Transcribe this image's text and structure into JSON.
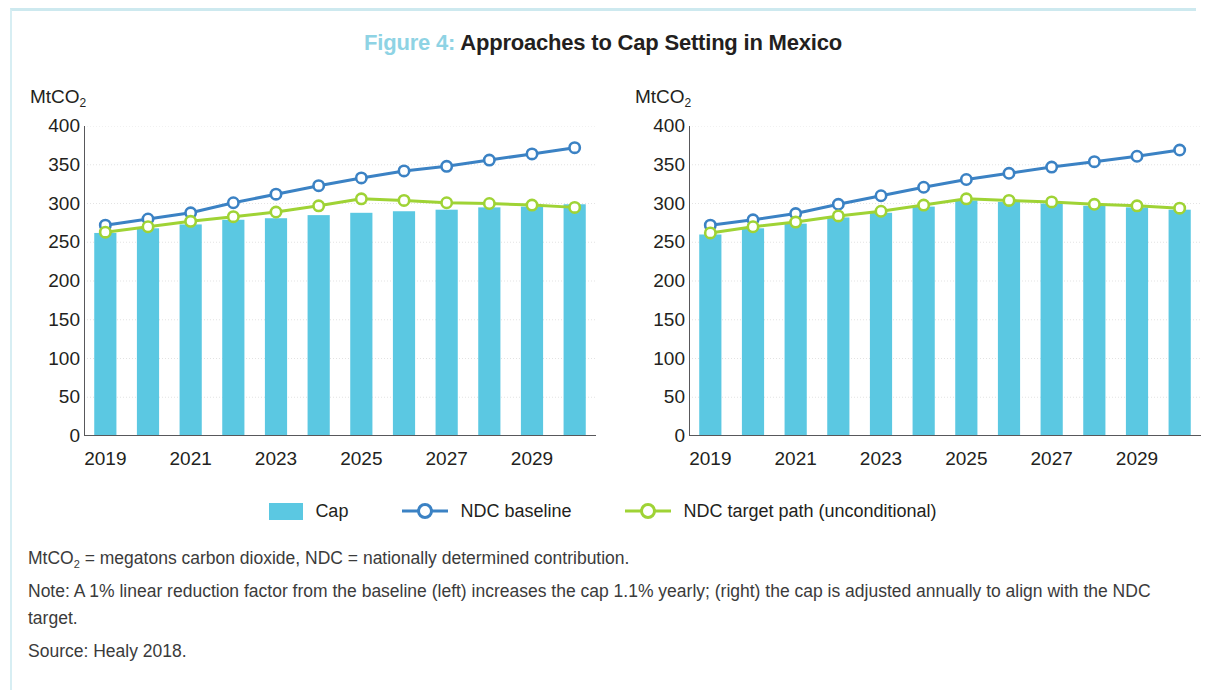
{
  "figure": {
    "label": "Figure 4:",
    "title": "Approaches to Cap Setting in Mexico",
    "label_color": "#8ed3e4",
    "title_color": "#231f20"
  },
  "colors": {
    "cap_bar": "#5bc8e2",
    "ndc_baseline": "#3b82c4",
    "ndc_target": "#9fd335",
    "marker_fill": "#ffffff",
    "gridline": "#e3e3e3",
    "axis": "#58585b",
    "border": "#cde9ef"
  },
  "legend": {
    "items": [
      {
        "label": "Cap",
        "type": "bar",
        "color": "#5bc8e2"
      },
      {
        "label": "NDC baseline",
        "type": "line-marker",
        "color": "#3b82c4"
      },
      {
        "label": "NDC target path (unconditional)",
        "type": "line-marker",
        "color": "#9fd335"
      }
    ]
  },
  "notes": {
    "abbrev_pre": "MtCO",
    "abbrev_sub": "2",
    "abbrev_post": " = megatons carbon dioxide, NDC = nationally determined contribution.",
    "note": "Note: A 1% linear reduction factor from the baseline (left) increases the cap 1.1% yearly; (right) the cap is adjusted annually to align with the NDC target.",
    "source": "Source: Healy 2018."
  },
  "chart_data": [
    {
      "type": "bar",
      "panel": "left",
      "title": "",
      "ylabel": "MtCO2",
      "ylabel_pre": "MtCO",
      "ylabel_sub": "2",
      "xlabel": "",
      "ylim": [
        0,
        400
      ],
      "yticks": [
        0,
        50,
        100,
        150,
        200,
        250,
        300,
        350,
        400
      ],
      "grid": true,
      "legend_position": "bottom",
      "x": [
        2019,
        2020,
        2021,
        2022,
        2023,
        2024,
        2025,
        2026,
        2027,
        2028,
        2029,
        2030
      ],
      "xtick_labels": [
        "2019",
        "2021",
        "2023",
        "2025",
        "2027",
        "2029"
      ],
      "xtick_values": [
        2019,
        2021,
        2023,
        2025,
        2027,
        2029
      ],
      "categories": [
        "2019",
        "2020",
        "2021",
        "2022",
        "2023",
        "2024",
        "2025",
        "2026",
        "2027",
        "2028",
        "2029",
        "2030"
      ],
      "values": [
        262,
        268,
        273,
        279,
        281,
        285,
        288,
        290,
        292,
        295,
        296,
        299
      ],
      "series": [
        {
          "name": "Cap",
          "type": "bar",
          "color": "#5bc8e2",
          "values": [
            262,
            268,
            273,
            279,
            281,
            285,
            288,
            290,
            292,
            295,
            296,
            299
          ]
        },
        {
          "name": "NDC baseline",
          "type": "line",
          "color": "#3b82c4",
          "marker": "open-circle",
          "values": [
            272,
            280,
            288,
            301,
            312,
            323,
            333,
            342,
            348,
            356,
            364,
            372
          ]
        },
        {
          "name": "NDC target path (unconditional)",
          "type": "line",
          "color": "#9fd335",
          "marker": "open-circle",
          "values": [
            263,
            270,
            277,
            283,
            289,
            297,
            306,
            304,
            301,
            300,
            298,
            295
          ]
        }
      ]
    },
    {
      "type": "bar",
      "panel": "right",
      "title": "",
      "ylabel": "MtCO2",
      "ylabel_pre": "MtCO",
      "ylabel_sub": "2",
      "xlabel": "",
      "ylim": [
        0,
        400
      ],
      "yticks": [
        0,
        50,
        100,
        150,
        200,
        250,
        300,
        350,
        400
      ],
      "grid": true,
      "legend_position": "bottom",
      "x": [
        2019,
        2020,
        2021,
        2022,
        2023,
        2024,
        2025,
        2026,
        2027,
        2028,
        2029,
        2030
      ],
      "xtick_labels": [
        "2019",
        "2021",
        "2023",
        "2025",
        "2027",
        "2029"
      ],
      "xtick_values": [
        2019,
        2021,
        2023,
        2025,
        2027,
        2029
      ],
      "categories": [
        "2019",
        "2020",
        "2021",
        "2022",
        "2023",
        "2024",
        "2025",
        "2026",
        "2027",
        "2028",
        "2029",
        "2030"
      ],
      "values": [
        260,
        268,
        274,
        282,
        288,
        296,
        304,
        302,
        300,
        297,
        295,
        292
      ],
      "series": [
        {
          "name": "Cap",
          "type": "bar",
          "color": "#5bc8e2",
          "values": [
            260,
            268,
            274,
            282,
            288,
            296,
            304,
            302,
            300,
            297,
            295,
            292
          ]
        },
        {
          "name": "NDC baseline",
          "type": "line",
          "color": "#3b82c4",
          "marker": "open-circle",
          "values": [
            272,
            279,
            287,
            299,
            310,
            321,
            331,
            339,
            347,
            354,
            361,
            369
          ]
        },
        {
          "name": "NDC target path (unconditional)",
          "type": "line",
          "color": "#9fd335",
          "marker": "open-circle",
          "values": [
            262,
            270,
            276,
            284,
            290,
            298,
            306,
            304,
            302,
            299,
            297,
            294
          ]
        }
      ]
    }
  ]
}
